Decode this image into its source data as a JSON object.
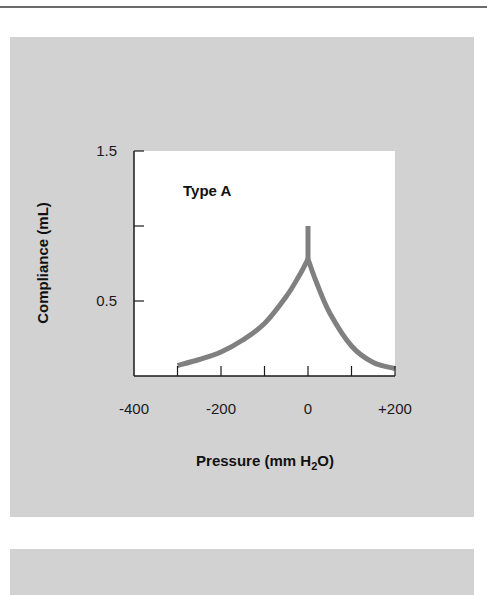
{
  "chart_data": {
    "type": "line",
    "title": "",
    "annotation": "Type A",
    "xlabel": "Pressure (mm H2O)",
    "xlabel_parts": {
      "pre": "Pressure (mm H",
      "sub": "2",
      "post": "O)"
    },
    "ylabel": "Compliance (mL)",
    "xlim": [
      -400,
      200
    ],
    "ylim": [
      0,
      1.5
    ],
    "x_tick_labels": [
      "-400",
      "-200",
      "0",
      "+200"
    ],
    "x_tick_values_labeled": [
      -400,
      -200,
      0,
      200
    ],
    "x_tick_marks": [
      -300,
      -200,
      -100,
      0,
      100,
      200
    ],
    "y_tick_labels": [
      "1.5",
      "0.5"
    ],
    "y_tick_values_labeled": [
      1.5,
      0.5
    ],
    "y_tick_marks": [
      1.5,
      1.0,
      0.5
    ],
    "grid": false,
    "legend": null,
    "series": [
      {
        "name": "Type A",
        "color": "#808080",
        "x": [
          -300,
          -250,
          -200,
          -150,
          -100,
          -50,
          -20,
          0,
          0,
          20,
          50,
          100,
          150,
          200
        ],
        "y": [
          0.07,
          0.11,
          0.16,
          0.24,
          0.35,
          0.53,
          0.67,
          0.78,
          1.0,
          0.62,
          0.42,
          0.2,
          0.09,
          0.05
        ]
      }
    ]
  },
  "colors": {
    "panel_bg": "#d2d2d2",
    "plot_bg": "#ffffff",
    "curve": "#808080",
    "axis": "#1a1a1a",
    "rule": "#6a6a6a"
  }
}
